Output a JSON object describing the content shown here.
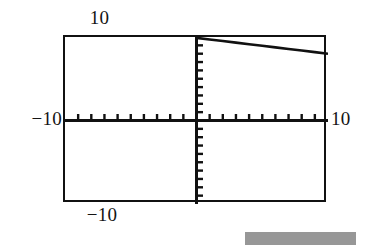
{
  "figure": {
    "kind": "graphing-calculator-screen",
    "background_color": "#ffffff",
    "ink_color": "#111111"
  },
  "labels": {
    "top": "10",
    "bottom": "−10",
    "left": "−10",
    "right": "10"
  },
  "artifact": {
    "name": "scan-artifact-bar",
    "color": "#8e8e8e"
  },
  "chart_data": {
    "type": "line",
    "title": "",
    "xlabel": "",
    "ylabel": "",
    "xlim": [
      -10,
      10
    ],
    "ylim": [
      -10,
      10
    ],
    "grid": false,
    "legend": "none",
    "xtick_interval": 1,
    "ytick_interval": 1,
    "xticks": [
      -10,
      -9,
      -8,
      -7,
      -6,
      -5,
      -4,
      -3,
      -2,
      -1,
      0,
      1,
      2,
      3,
      4,
      5,
      6,
      7,
      8,
      9,
      10
    ],
    "yticks": [
      -10,
      -9,
      -8,
      -7,
      -6,
      -5,
      -4,
      -3,
      -2,
      -1,
      0,
      1,
      2,
      3,
      4,
      5,
      6,
      7,
      8,
      9,
      10
    ],
    "tick_labels_shown": [
      "10",
      "−10",
      "−10",
      "10"
    ],
    "axis_style": "calculator-crosshair",
    "series": [
      {
        "name": "line",
        "style": "solid",
        "color": "#111111",
        "slope": -0.19,
        "intercept": 9.9,
        "x_range": [
          0,
          10
        ],
        "points": [
          {
            "x": 0,
            "y": 9.9
          },
          {
            "x": 1,
            "y": 9.71
          },
          {
            "x": 2,
            "y": 9.52
          },
          {
            "x": 3,
            "y": 9.33
          },
          {
            "x": 4,
            "y": 9.14
          },
          {
            "x": 5,
            "y": 8.95
          },
          {
            "x": 6,
            "y": 8.76
          },
          {
            "x": 7,
            "y": 8.57
          },
          {
            "x": 8,
            "y": 8.38
          },
          {
            "x": 9,
            "y": 8.19
          },
          {
            "x": 10,
            "y": 8.0
          }
        ]
      }
    ]
  }
}
